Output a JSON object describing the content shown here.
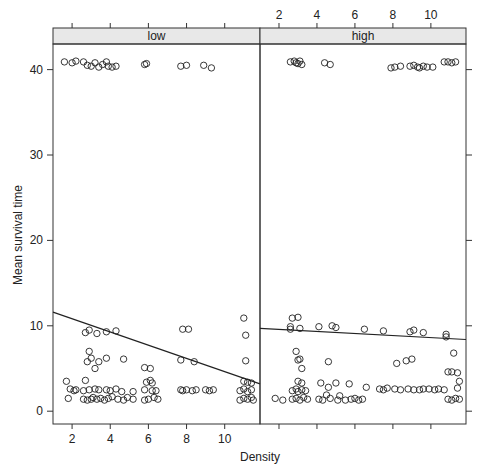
{
  "chart_data": {
    "type": "scatter",
    "layout": "lattice-two-panel",
    "xlabel": "Density",
    "ylabel": "Mean survival time",
    "ylim": [
      -1.5,
      43
    ],
    "xlim": [
      1.0,
      11.85
    ],
    "x_ticks": [
      2,
      4,
      6,
      8,
      10
    ],
    "y_ticks": [
      0,
      10,
      20,
      30,
      40
    ],
    "x_ticks_position": {
      "low": "bottom",
      "high": "top"
    },
    "y_ticks_position": {
      "labels": "left",
      "ticks_only": "right"
    },
    "grid": false,
    "legend": null,
    "panels": [
      {
        "strip": "low",
        "fit_line": {
          "x": [
            1.0,
            11.85
          ],
          "y": [
            11.6,
            3.2
          ]
        },
        "points": [
          [
            1.6,
            40.9
          ],
          [
            2.0,
            40.8
          ],
          [
            2.2,
            41.0
          ],
          [
            2.6,
            40.9
          ],
          [
            2.8,
            40.5
          ],
          [
            3.0,
            40.4
          ],
          [
            3.2,
            40.8
          ],
          [
            3.4,
            40.3
          ],
          [
            3.6,
            40.6
          ],
          [
            3.8,
            40.9
          ],
          [
            3.9,
            40.4
          ],
          [
            4.1,
            40.3
          ],
          [
            4.3,
            40.4
          ],
          [
            5.8,
            40.6
          ],
          [
            5.9,
            40.7
          ],
          [
            7.7,
            40.4
          ],
          [
            8.0,
            40.5
          ],
          [
            8.9,
            40.5
          ],
          [
            9.3,
            40.2
          ],
          [
            2.7,
            9.2
          ],
          [
            2.9,
            9.5
          ],
          [
            3.3,
            9.1
          ],
          [
            3.8,
            9.3
          ],
          [
            4.3,
            9.4
          ],
          [
            7.8,
            9.6
          ],
          [
            8.1,
            9.6
          ],
          [
            11.0,
            10.9
          ],
          [
            11.1,
            8.9
          ],
          [
            2.9,
            7.0
          ],
          [
            2.8,
            5.8
          ],
          [
            3.0,
            6.2
          ],
          [
            3.2,
            5.0
          ],
          [
            3.4,
            5.8
          ],
          [
            3.8,
            6.2
          ],
          [
            4.7,
            6.1
          ],
          [
            5.8,
            5.1
          ],
          [
            6.1,
            5.0
          ],
          [
            7.7,
            6.0
          ],
          [
            8.4,
            5.8
          ],
          [
            11.1,
            5.9
          ],
          [
            1.7,
            3.5
          ],
          [
            2.7,
            3.6
          ],
          [
            5.9,
            3.4
          ],
          [
            6.1,
            3.6
          ],
          [
            6.2,
            3.3
          ],
          [
            11.0,
            3.5
          ],
          [
            11.2,
            3.4
          ],
          [
            11.4,
            3.3
          ],
          [
            1.9,
            2.6
          ],
          [
            2.1,
            2.4
          ],
          [
            2.2,
            2.5
          ],
          [
            2.6,
            2.4
          ],
          [
            2.9,
            2.5
          ],
          [
            3.2,
            2.6
          ],
          [
            3.4,
            2.5
          ],
          [
            3.8,
            2.5
          ],
          [
            4.0,
            2.4
          ],
          [
            4.3,
            2.6
          ],
          [
            4.6,
            2.3
          ],
          [
            5.2,
            2.3
          ],
          [
            5.8,
            2.5
          ],
          [
            6.2,
            2.4
          ],
          [
            6.4,
            2.4
          ],
          [
            7.7,
            2.5
          ],
          [
            7.8,
            2.4
          ],
          [
            8.0,
            2.5
          ],
          [
            8.3,
            2.4
          ],
          [
            8.5,
            2.5
          ],
          [
            9.0,
            2.5
          ],
          [
            9.2,
            2.4
          ],
          [
            9.4,
            2.5
          ],
          [
            10.8,
            2.4
          ],
          [
            11.0,
            2.6
          ],
          [
            11.2,
            2.3
          ],
          [
            11.4,
            2.5
          ],
          [
            1.8,
            1.5
          ],
          [
            2.6,
            1.4
          ],
          [
            2.8,
            1.3
          ],
          [
            3.0,
            1.4
          ],
          [
            3.1,
            1.6
          ],
          [
            3.3,
            1.4
          ],
          [
            3.5,
            1.5
          ],
          [
            3.7,
            1.3
          ],
          [
            3.9,
            1.5
          ],
          [
            4.1,
            1.7
          ],
          [
            4.4,
            1.4
          ],
          [
            4.7,
            1.3
          ],
          [
            4.9,
            1.6
          ],
          [
            5.2,
            1.4
          ],
          [
            5.8,
            1.3
          ],
          [
            6.0,
            1.4
          ],
          [
            6.3,
            1.6
          ],
          [
            6.5,
            1.4
          ],
          [
            10.8,
            1.3
          ],
          [
            11.0,
            1.5
          ],
          [
            11.2,
            1.4
          ],
          [
            11.4,
            1.6
          ],
          [
            11.5,
            1.3
          ]
        ]
      },
      {
        "strip": "high",
        "fit_line": {
          "x": [
            1.0,
            11.85
          ],
          "y": [
            9.7,
            8.4
          ]
        },
        "points": [
          [
            2.6,
            40.9
          ],
          [
            2.8,
            41.0
          ],
          [
            2.9,
            40.8
          ],
          [
            3.0,
            40.7
          ],
          [
            3.1,
            41.0
          ],
          [
            3.2,
            40.6
          ],
          [
            4.4,
            40.8
          ],
          [
            4.7,
            40.6
          ],
          [
            7.9,
            40.2
          ],
          [
            8.1,
            40.3
          ],
          [
            8.4,
            40.4
          ],
          [
            8.9,
            40.4
          ],
          [
            9.1,
            40.5
          ],
          [
            9.3,
            40.3
          ],
          [
            9.4,
            40.2
          ],
          [
            9.6,
            40.4
          ],
          [
            9.8,
            40.3
          ],
          [
            10.1,
            40.3
          ],
          [
            10.7,
            40.9
          ],
          [
            10.9,
            40.9
          ],
          [
            11.1,
            40.8
          ],
          [
            11.3,
            40.9
          ],
          [
            2.7,
            10.9
          ],
          [
            3.0,
            11.0
          ],
          [
            2.6,
            9.6
          ],
          [
            2.6,
            9.9
          ],
          [
            3.1,
            9.7
          ],
          [
            4.1,
            9.9
          ],
          [
            4.8,
            10.0
          ],
          [
            5.0,
            9.8
          ],
          [
            6.5,
            9.6
          ],
          [
            7.5,
            9.4
          ],
          [
            8.9,
            9.3
          ],
          [
            9.1,
            9.5
          ],
          [
            9.6,
            9.2
          ],
          [
            10.8,
            9.0
          ],
          [
            10.8,
            8.7
          ],
          [
            2.9,
            7.0
          ],
          [
            3.0,
            6.0
          ],
          [
            3.1,
            6.1
          ],
          [
            3.2,
            5.0
          ],
          [
            4.6,
            5.8
          ],
          [
            8.2,
            5.6
          ],
          [
            8.7,
            5.9
          ],
          [
            9.0,
            6.1
          ],
          [
            10.9,
            4.6
          ],
          [
            11.1,
            4.6
          ],
          [
            11.4,
            4.5
          ],
          [
            11.5,
            3.5
          ],
          [
            11.2,
            6.8
          ],
          [
            3.0,
            3.5
          ],
          [
            3.2,
            3.3
          ],
          [
            4.2,
            3.3
          ],
          [
            4.6,
            2.8
          ],
          [
            5.0,
            3.3
          ],
          [
            5.7,
            3.2
          ],
          [
            6.6,
            2.8
          ],
          [
            11.4,
            2.7
          ],
          [
            2.7,
            2.4
          ],
          [
            2.9,
            2.6
          ],
          [
            3.0,
            2.3
          ],
          [
            3.2,
            2.5
          ],
          [
            3.4,
            2.4
          ],
          [
            4.5,
            1.9
          ],
          [
            5.2,
            1.8
          ],
          [
            7.3,
            2.6
          ],
          [
            7.5,
            2.5
          ],
          [
            7.7,
            2.7
          ],
          [
            8.1,
            2.6
          ],
          [
            8.4,
            2.5
          ],
          [
            8.8,
            2.6
          ],
          [
            9.1,
            2.5
          ],
          [
            9.4,
            2.5
          ],
          [
            9.6,
            2.6
          ],
          [
            9.9,
            2.6
          ],
          [
            10.2,
            2.5
          ],
          [
            10.4,
            2.6
          ],
          [
            10.7,
            2.5
          ],
          [
            1.8,
            1.5
          ],
          [
            2.2,
            1.3
          ],
          [
            2.7,
            1.4
          ],
          [
            2.9,
            1.5
          ],
          [
            3.1,
            1.3
          ],
          [
            3.3,
            1.6
          ],
          [
            3.5,
            1.4
          ],
          [
            4.1,
            1.4
          ],
          [
            4.3,
            1.3
          ],
          [
            4.7,
            1.5
          ],
          [
            5.1,
            1.3
          ],
          [
            5.5,
            1.3
          ],
          [
            5.8,
            1.4
          ],
          [
            6.0,
            1.5
          ],
          [
            6.2,
            1.3
          ],
          [
            6.4,
            1.4
          ],
          [
            10.9,
            1.4
          ],
          [
            11.1,
            1.3
          ],
          [
            11.3,
            1.5
          ],
          [
            11.5,
            1.4
          ]
        ]
      }
    ]
  }
}
